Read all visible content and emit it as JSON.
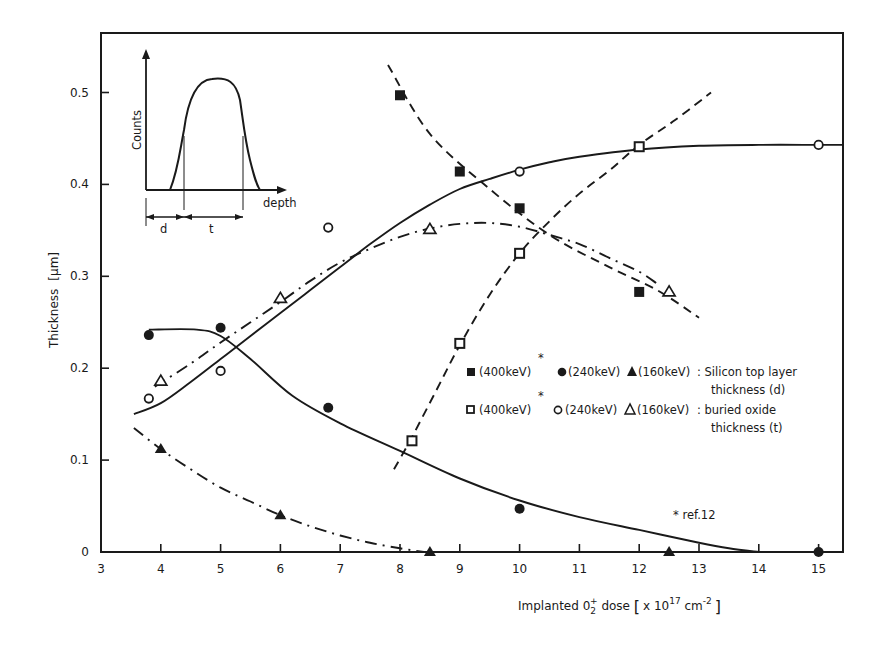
{
  "chart_data": {
    "type": "scatter",
    "title": "",
    "xlabel": "Implanted O2+ dose [x 10^17 cm^-2]",
    "xlabel_parts": {
      "main": "Implanted  0",
      "sub": "2",
      "sup": "+",
      "rest": " dose ",
      "bracket_open": "[",
      "unit_pre": "x 10",
      "unit_exp": "17",
      "unit_mid": " cm",
      "unit_exp2": "-2",
      "bracket_close": "]"
    },
    "ylabel": "Thickness [µm]",
    "ylabel_parts": {
      "main": "Thickness",
      "unit": "[µm]"
    },
    "xlim": [
      3,
      15.5
    ],
    "ylim": [
      0,
      0.55
    ],
    "x_ticks": [
      3,
      4,
      5,
      6,
      7,
      8,
      9,
      10,
      11,
      12,
      13,
      14,
      15
    ],
    "y_ticks": [
      0,
      0.1,
      0.2,
      0.3,
      0.4,
      0.5
    ],
    "y_tick_labels": [
      "0",
      "0.1",
      "0.2",
      "0.3",
      "0.4",
      "0.5"
    ],
    "grid": false,
    "series": [
      {
        "name": "(400keV)* Silicon top layer thickness (d)",
        "marker": "filled-square",
        "line": "dashed",
        "points": [
          [
            8.0,
            0.497
          ],
          [
            9.0,
            0.414
          ],
          [
            10.0,
            0.374
          ],
          [
            12.0,
            0.283
          ]
        ],
        "curve": [
          [
            7.8,
            0.53
          ],
          [
            8.5,
            0.455
          ],
          [
            9.5,
            0.395
          ],
          [
            10.5,
            0.345
          ],
          [
            11.5,
            0.31
          ],
          [
            12.3,
            0.285
          ],
          [
            13.0,
            0.255
          ]
        ]
      },
      {
        "name": "(240keV) Silicon top layer thickness (d)",
        "marker": "filled-circle",
        "line": "solid",
        "points": [
          [
            3.8,
            0.236
          ],
          [
            5.0,
            0.244
          ],
          [
            6.8,
            0.157
          ],
          [
            10.0,
            0.047
          ],
          [
            15.0,
            0.0
          ]
        ],
        "curve": [
          [
            3.8,
            0.242
          ],
          [
            4.6,
            0.242
          ],
          [
            5.0,
            0.235
          ],
          [
            5.5,
            0.21
          ],
          [
            6.2,
            0.17
          ],
          [
            7.0,
            0.14
          ],
          [
            8.0,
            0.11
          ],
          [
            9.0,
            0.08
          ],
          [
            10.0,
            0.056
          ],
          [
            11.0,
            0.038
          ],
          [
            12.0,
            0.024
          ],
          [
            13.0,
            0.01
          ],
          [
            13.5,
            0.004
          ],
          [
            14.0,
            0.0
          ]
        ]
      },
      {
        "name": "(160keV) Silicon top layer thickness (d)",
        "marker": "filled-triangle",
        "line": "dash-dot",
        "points": [
          [
            4.0,
            0.112
          ],
          [
            6.0,
            0.04
          ],
          [
            8.5,
            0.0
          ],
          [
            12.5,
            0.0
          ]
        ],
        "curve": [
          [
            3.55,
            0.135
          ],
          [
            4.0,
            0.112
          ],
          [
            4.5,
            0.09
          ],
          [
            5.0,
            0.07
          ],
          [
            5.5,
            0.055
          ],
          [
            6.0,
            0.04
          ],
          [
            6.5,
            0.028
          ],
          [
            7.0,
            0.018
          ],
          [
            7.5,
            0.01
          ],
          [
            8.0,
            0.004
          ],
          [
            8.4,
            0.0
          ]
        ]
      },
      {
        "name": "(400keV)* buried oxide thickness (t)",
        "marker": "open-square",
        "line": "dashed",
        "points": [
          [
            8.2,
            0.121
          ],
          [
            9.0,
            0.227
          ],
          [
            10.0,
            0.325
          ],
          [
            12.0,
            0.441
          ]
        ],
        "curve": [
          [
            7.9,
            0.09
          ],
          [
            8.2,
            0.125
          ],
          [
            8.6,
            0.175
          ],
          [
            9.0,
            0.225
          ],
          [
            9.5,
            0.28
          ],
          [
            10.0,
            0.325
          ],
          [
            10.5,
            0.36
          ],
          [
            11.0,
            0.39
          ],
          [
            11.5,
            0.415
          ],
          [
            12.0,
            0.443
          ],
          [
            12.6,
            0.47
          ],
          [
            13.2,
            0.5
          ]
        ]
      },
      {
        "name": "(240keV) buried oxide thickness (t)",
        "marker": "open-circle",
        "line": "solid",
        "points": [
          [
            3.8,
            0.167
          ],
          [
            5.0,
            0.197
          ],
          [
            6.8,
            0.353
          ],
          [
            10.0,
            0.414
          ],
          [
            15.0,
            0.443
          ]
        ],
        "curve": [
          [
            3.55,
            0.15
          ],
          [
            4.0,
            0.162
          ],
          [
            4.5,
            0.185
          ],
          [
            5.0,
            0.21
          ],
          [
            5.5,
            0.235
          ],
          [
            6.0,
            0.26
          ],
          [
            6.5,
            0.285
          ],
          [
            7.0,
            0.31
          ],
          [
            7.5,
            0.335
          ],
          [
            8.0,
            0.358
          ],
          [
            8.5,
            0.378
          ],
          [
            9.0,
            0.395
          ],
          [
            9.5,
            0.406
          ],
          [
            10.0,
            0.416
          ],
          [
            10.5,
            0.424
          ],
          [
            11.0,
            0.43
          ],
          [
            12.0,
            0.438
          ],
          [
            13.0,
            0.442
          ],
          [
            14.0,
            0.443
          ],
          [
            15.0,
            0.443
          ],
          [
            15.4,
            0.443
          ]
        ]
      },
      {
        "name": "(160keV) buried oxide thickness (t)",
        "marker": "open-triangle",
        "line": "dash-dot",
        "points": [
          [
            4.0,
            0.186
          ],
          [
            6.0,
            0.276
          ],
          [
            8.5,
            0.351
          ],
          [
            12.5,
            0.283
          ]
        ],
        "curve": [
          [
            3.9,
            0.18
          ],
          [
            4.5,
            0.205
          ],
          [
            5.0,
            0.228
          ],
          [
            5.5,
            0.25
          ],
          [
            6.0,
            0.272
          ],
          [
            6.5,
            0.295
          ],
          [
            7.0,
            0.315
          ],
          [
            7.5,
            0.33
          ],
          [
            8.0,
            0.343
          ],
          [
            8.5,
            0.352
          ],
          [
            9.0,
            0.357
          ],
          [
            9.5,
            0.358
          ],
          [
            10.0,
            0.354
          ],
          [
            10.5,
            0.345
          ],
          [
            11.0,
            0.335
          ],
          [
            11.5,
            0.32
          ],
          [
            12.0,
            0.305
          ],
          [
            12.3,
            0.292
          ]
        ]
      }
    ],
    "legend": {
      "position": "inside-right-middle",
      "rows": [
        {
          "entries": [
            {
              "marker": "filled-square",
              "label": "(400keV)",
              "star": "*"
            },
            {
              "marker": "filled-circle",
              "label": "(240keV)"
            },
            {
              "marker": "filled-triangle",
              "label": "(160keV)"
            }
          ],
          "desc_line1": ": Silicon top layer",
          "desc_line2": "thickness (d)"
        },
        {
          "entries": [
            {
              "marker": "open-square",
              "label": "(400keV)",
              "star": "*"
            },
            {
              "marker": "open-circle",
              "label": "(240keV)"
            },
            {
              "marker": "open-triangle",
              "label": "(160keV)"
            }
          ],
          "desc_line1": ": buried oxide",
          "desc_line2": "thickness (t)"
        }
      ]
    },
    "annotations": [
      {
        "text": "* ref.12",
        "x": 13.0,
        "y": 0.04
      }
    ],
    "inset": {
      "description": "Schematic RBS depth profile of buried oxide peak",
      "ylabel": "Counts",
      "xlabel": "depth",
      "segment_labels": [
        "d",
        "t"
      ]
    }
  },
  "colors": {
    "ink": "#1a1a1a",
    "background": "#ffffff"
  }
}
